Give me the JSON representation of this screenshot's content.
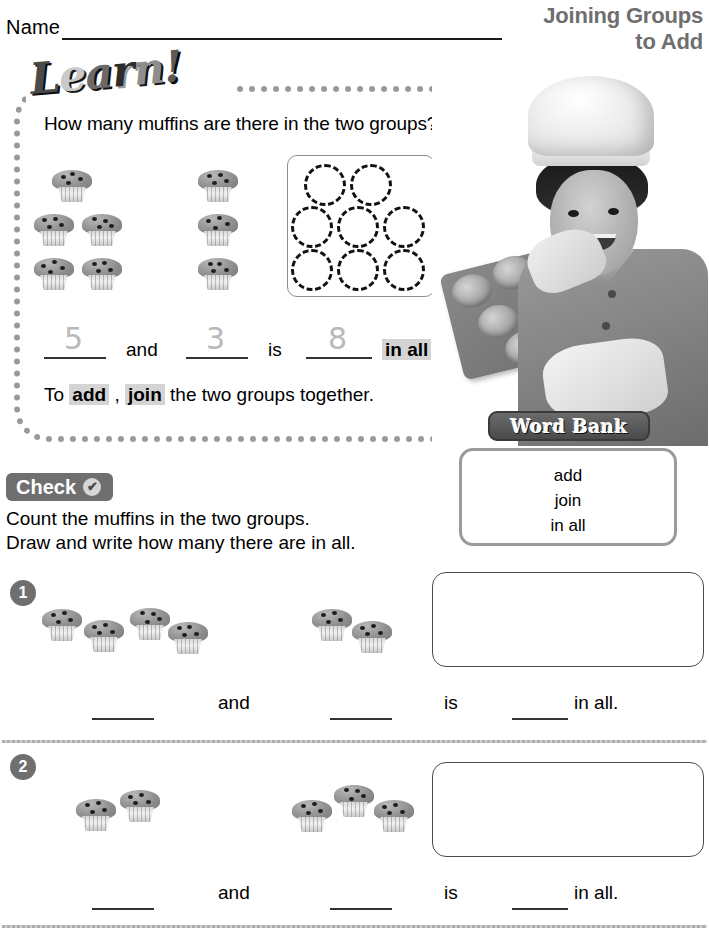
{
  "header": {
    "name_label": "Name",
    "title_line1": "Joining Groups",
    "title_line2": "to Add"
  },
  "learn": {
    "badge_text": "Learn!",
    "question": "How many muffins are there in the two groups?",
    "group1_count": 5,
    "group2_count": 3,
    "tenframe_circles": 8,
    "equation": {
      "value1": "5",
      "and": "and",
      "value2": "3",
      "is": "is",
      "total": "8",
      "in_all": "in all",
      "period": "."
    },
    "sentence_prefix": "To ",
    "sentence_word1": "add",
    "sentence_comma": " , ",
    "sentence_word2": "join",
    "sentence_suffix": " the two groups together."
  },
  "word_bank": {
    "tab_label": "Word Bank",
    "words": [
      "add",
      "join",
      "in all"
    ]
  },
  "check": {
    "tab_label": "Check",
    "check_icon": "✔",
    "line1": "Count the muffins in the two groups.",
    "line2": "Draw and write how many there are in all."
  },
  "exercises": [
    {
      "number": "1",
      "group1_count": 4,
      "group2_count": 2,
      "and_label": "and",
      "is_label": "is",
      "in_all_label": "in all."
    },
    {
      "number": "2",
      "group1_count": 2,
      "group2_count": 3,
      "and_label": "and",
      "is_label": "is",
      "in_all_label": "in all."
    }
  ],
  "colors": {
    "title_gray": "#6e6e6e",
    "tab_gray": "#6f6f6f",
    "highlight_gray": "#d4d4d4",
    "border_gray": "#9a9a9a"
  }
}
